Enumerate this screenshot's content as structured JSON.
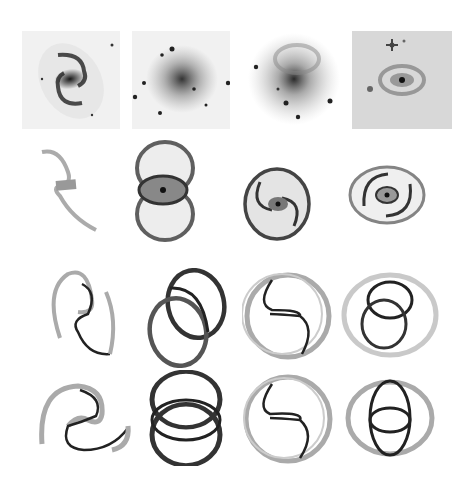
{
  "figure": {
    "rows": [
      {
        "name": "observed-galaxies",
        "panels": 4,
        "description": "Grayscale photographs of barred/ringed spiral galaxies"
      },
      {
        "name": "n-body-simulations",
        "panels": 4,
        "description": "Particle simulations of spiral/ring morphology"
      },
      {
        "name": "orbit-model-inclined",
        "panels": 4,
        "description": "Periodic orbit ring models, inclined view"
      },
      {
        "name": "orbit-model-face-on",
        "panels": 4,
        "description": "Periodic orbit ring models, face-on view"
      }
    ],
    "colors": {
      "background": "#ffffff",
      "ink": "#1a1a1a",
      "light_ink": "#9a9a9a",
      "photo_bg": "#eeeeee",
      "photo_bg_dark": "#d4d4d4"
    }
  }
}
